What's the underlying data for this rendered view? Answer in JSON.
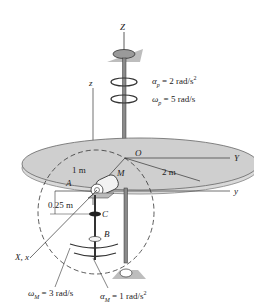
{
  "axes": {
    "Z": "Z",
    "z": "z",
    "Y": "Y",
    "y": "y",
    "Xx": "X, x"
  },
  "points": {
    "O": "O",
    "M": "M",
    "A": "A",
    "B": "B",
    "C": "C"
  },
  "dimensions": {
    "disk_radius": "2 m",
    "arm_radius": "1 m",
    "offset": "0.25 m"
  },
  "kinematics": {
    "alpha_p": "α",
    "alpha_p_sub": "p",
    "alpha_p_val": " = 2 rad/s",
    "alpha_p_sup": "2",
    "omega_p": "ω",
    "omega_p_sub": "p",
    "omega_p_val": " = 5 rad/s",
    "omega_M": "ω",
    "omega_M_sub": "M",
    "omega_M_val": " = 3 rad/s",
    "alpha_M": "α",
    "alpha_M_sub": "M",
    "alpha_M_val": " = 1 rad/s",
    "alpha_M_sup": "2"
  },
  "colors": {
    "disk_fill": "#cfcfcf",
    "disk_edge": "#a8a8a8",
    "line": "#333333"
  }
}
